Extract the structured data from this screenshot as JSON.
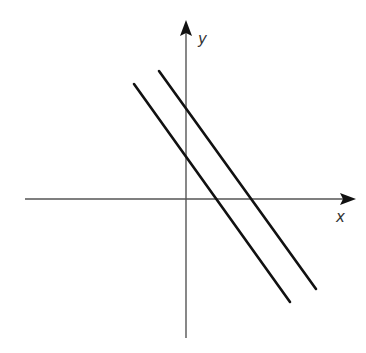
{
  "diagram": {
    "type": "coordinate-plane-parallel-lines",
    "axes": {
      "x_label": "x",
      "y_label": "y",
      "color": "#555555"
    },
    "lines": [
      {
        "name": "line-1",
        "from": [
          134,
          84
        ],
        "to": [
          290,
          302
        ],
        "color": "#111111"
      },
      {
        "name": "line-2",
        "from": [
          159,
          71
        ],
        "to": [
          316,
          289
        ],
        "color": "#111111"
      }
    ]
  }
}
